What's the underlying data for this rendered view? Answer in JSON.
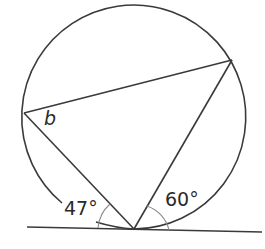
{
  "diagram": {
    "type": "circle-theorem",
    "labels": {
      "angle_b": "b",
      "angle_left": "47°",
      "angle_right": "60°"
    },
    "colors": {
      "stroke": "#3a3a3a",
      "arc_mark": "#8a8a8a",
      "text": "#2a2a2a",
      "background": "#ffffff"
    }
  }
}
